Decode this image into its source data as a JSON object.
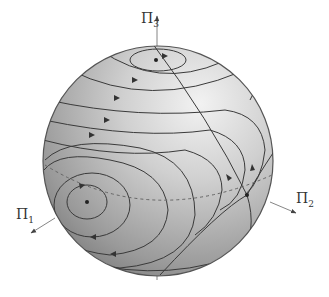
{
  "diagram": {
    "type": "sphere-phase-portrait",
    "sphere": {
      "cx": 158,
      "cy": 161,
      "r": 115,
      "fill_light": "#e6e6e6",
      "fill_dark": "#7a7a7a",
      "stroke": "#555555"
    },
    "axes": [
      {
        "id": "pi3",
        "symbol": "Π",
        "sub": "3",
        "label_x": 141,
        "label_y": 10
      },
      {
        "id": "pi1",
        "symbol": "Π",
        "sub": "1",
        "label_x": 16,
        "label_y": 206
      },
      {
        "id": "pi2",
        "symbol": "Π",
        "sub": "2",
        "label_x": 296,
        "label_y": 190
      }
    ],
    "curve_color": "#3a3a3a",
    "fixed_points": [
      {
        "name": "top-center",
        "x": 156,
        "y": 60
      },
      {
        "name": "left-center",
        "x": 87,
        "y": 202
      },
      {
        "name": "saddle",
        "x": 247,
        "y": 195
      }
    ]
  }
}
